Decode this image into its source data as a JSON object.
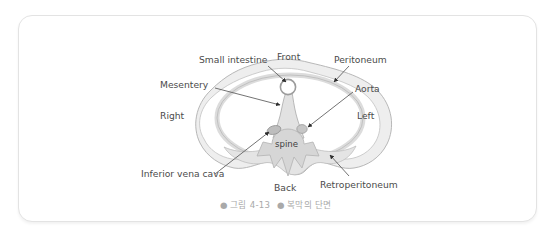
{
  "figure": {
    "caption_bullet": "●",
    "caption_number": "그림 4-13",
    "caption_title": "복막의 단면",
    "card_border_color": "#e3e3e3",
    "background_color": "#ffffff",
    "label_color": "#4b4b4b",
    "caption_color": "#a9a9a9",
    "anatomy_fill": "#e9e9e9",
    "anatomy_stroke": "#a8a8a8",
    "organ_fill": "#cfcfcf",
    "leader_color": "#5a5a5a"
  },
  "labels": {
    "small_intestine": "Small intestine",
    "front": "Front",
    "peritoneum": "Peritoneum",
    "mesentery": "Mesentery",
    "aorta": "Aorta",
    "right": "Right",
    "left": "Left",
    "spine": "spine",
    "inferior_vena_cava": "Inferior vena cava",
    "back": "Back",
    "retroperitoneum": "Retroperitoneum"
  },
  "diagram": {
    "type": "anatomical-cross-section",
    "structures": [
      "body wall",
      "peritoneum band",
      "mesentery stalk",
      "small intestine loop",
      "aorta",
      "inferior vena cava",
      "spine vertebra",
      "retroperitoneum"
    ],
    "orientation": {
      "top": "Front",
      "bottom": "Back",
      "left_side_of_image": "Right",
      "right_side_of_image": "Left"
    }
  }
}
